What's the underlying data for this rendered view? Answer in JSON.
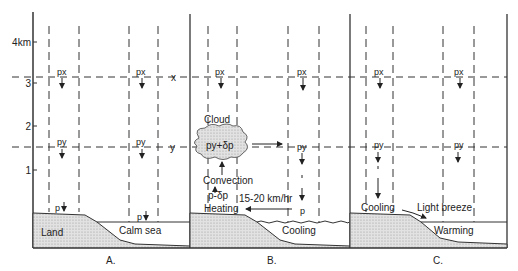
{
  "axis": {
    "ticks": [
      {
        "label": "4km",
        "y": 42
      },
      {
        "label": "3",
        "y": 83
      },
      {
        "label": "2",
        "y": 126
      },
      {
        "label": "1",
        "y": 170
      }
    ],
    "level_x_label": "x",
    "level_y_label": "y"
  },
  "panels": [
    {
      "id": "A",
      "caption": "A.",
      "labels": {
        "land": "Land",
        "sea": "Calm sea"
      },
      "pressure": {
        "px_left": "px",
        "px_right": "px",
        "py_left": "py",
        "py_right": "py",
        "p_left": "p",
        "p_right": "p"
      }
    },
    {
      "id": "B",
      "caption": "B.",
      "labels": {
        "cloud": "Cloud",
        "cloud_pressure": "py+δp",
        "convection": "Convection",
        "low_pressure": "p-δp",
        "heating": "Heating",
        "wind_speed": "15-20 km/hr",
        "sea": "Cooling"
      },
      "pressure": {
        "px_left": "px",
        "px_right": "px",
        "py_right": "py",
        "p_right": "p"
      }
    },
    {
      "id": "C",
      "caption": "C.",
      "labels": {
        "land": "Cooling",
        "breeze": "Light breeze",
        "sea": "Warming"
      },
      "pressure": {
        "px_left": "px",
        "px_right": "px",
        "py_left": "py",
        "py_right": "py"
      }
    }
  ]
}
